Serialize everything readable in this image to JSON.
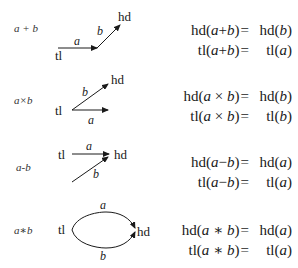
{
  "rows": [
    {
      "op_label": "a + b",
      "nodes": {
        "tail": "tl",
        "head": "hd"
      },
      "edges": [
        {
          "label": "a"
        },
        {
          "label": "b"
        }
      ],
      "equations": [
        {
          "lhs_fn": "hd",
          "arg_a": "a",
          "op": "+",
          "arg_b": "b",
          "eq": "=",
          "rhs_fn": "hd",
          "rhs_arg": "b"
        },
        {
          "lhs_fn": "tl",
          "arg_a": "a",
          "op": "+",
          "arg_b": "b",
          "eq": "=",
          "rhs_fn": "tl",
          "rhs_arg": "a"
        }
      ]
    },
    {
      "op_label": "a×b",
      "nodes": {
        "tail": "tl",
        "head": "hd"
      },
      "edges": [
        {
          "label": "b"
        },
        {
          "label": "a"
        }
      ],
      "equations": [
        {
          "lhs_fn": "hd",
          "arg_a": "a",
          "op": "×",
          "arg_b": "b",
          "eq": "=",
          "rhs_fn": "hd",
          "rhs_arg": "b"
        },
        {
          "lhs_fn": "tl",
          "arg_a": "a",
          "op": "×",
          "arg_b": "b",
          "eq": "=",
          "rhs_fn": "tl",
          "rhs_arg": "b"
        }
      ]
    },
    {
      "op_label": "a-b",
      "nodes": {
        "tail": "tl",
        "head": "hd"
      },
      "edges": [
        {
          "label": "a"
        },
        {
          "label": "b"
        }
      ],
      "equations": [
        {
          "lhs_fn": "hd",
          "arg_a": "a",
          "op": "−",
          "arg_b": "b",
          "eq": "=",
          "rhs_fn": "hd",
          "rhs_arg": "a"
        },
        {
          "lhs_fn": "tl",
          "arg_a": "a",
          "op": "−",
          "arg_b": "b",
          "eq": "=",
          "rhs_fn": "tl",
          "rhs_arg": "a"
        }
      ]
    },
    {
      "op_label": "a∗b",
      "nodes": {
        "tail": "tl",
        "head": "hd"
      },
      "edges": [
        {
          "label": "a"
        },
        {
          "label": "b"
        }
      ],
      "equations": [
        {
          "lhs_fn": "hd",
          "arg_a": "a",
          "op": "∗",
          "arg_b": "b",
          "eq": "=",
          "rhs_fn": "hd",
          "rhs_arg": "a"
        },
        {
          "lhs_fn": "tl",
          "arg_a": "a",
          "op": "∗",
          "arg_b": "b",
          "eq": "=",
          "rhs_fn": "tl",
          "rhs_arg": "a"
        }
      ]
    }
  ],
  "colors": {
    "ink": "#1a1a1a",
    "background": "#ffffff"
  }
}
